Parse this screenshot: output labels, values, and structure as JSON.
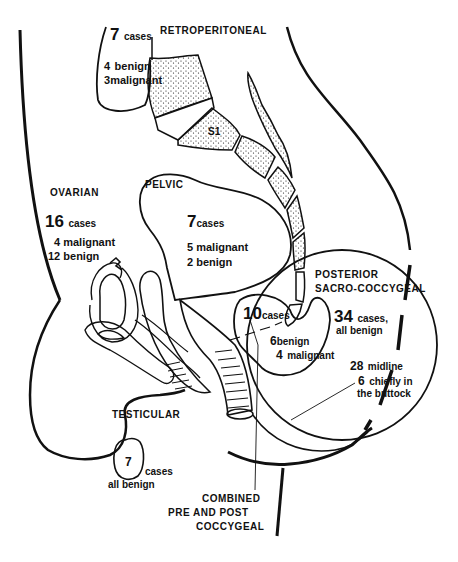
{
  "figure": {
    "type": "sagittal pelvic section diagram",
    "colors": {
      "ink": "#111111",
      "background": "#ffffff"
    }
  },
  "regions": {
    "retroperitoneal": {
      "title": "RETROPERITONEAL",
      "count": "7",
      "count_unit": "cases",
      "line1_num": "4",
      "line1_text": "benign",
      "line2_num": "3",
      "line2_text": "malignant"
    },
    "vertebra": {
      "label": "S1"
    },
    "ovarian": {
      "title": "OVARIAN",
      "count": "16",
      "count_unit": "cases",
      "line1": "4 malignant",
      "line2": "12 benign"
    },
    "pelvic": {
      "title": "PELVIC",
      "count": "7",
      "count_unit": "cases",
      "line1": "5 malignant",
      "line2": "2 benign"
    },
    "posterior_sacrococcygeal": {
      "title_line1": "POSTERIOR",
      "title_line2": "SACRO-COCCYGEAL",
      "count": "34",
      "count_unit": "cases,",
      "line1": "all benign",
      "sub1_num": "28",
      "sub1_text": "midline",
      "sub2_num": "6",
      "sub2_text": "chiefly in",
      "sub3_text": "the buttock"
    },
    "combined": {
      "count": "10",
      "count_unit": "cases",
      "line1_num": "6",
      "line1_text": "benign",
      "line2_num": "4",
      "line2_text": "malignant",
      "title_line1": "COMBINED",
      "title_line2": "PRE AND POST",
      "title_line3": "COCCYGEAL"
    },
    "testicular": {
      "title": "TESTICULAR",
      "count": "7",
      "count_unit": "cases",
      "line1": "all benign"
    }
  }
}
